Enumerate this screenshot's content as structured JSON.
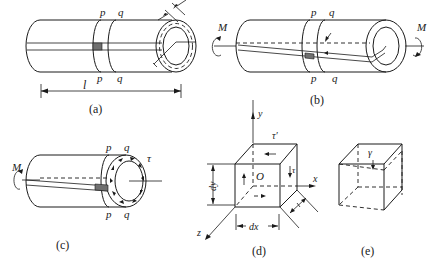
{
  "figure": {
    "panels": [
      {
        "id": "a",
        "caption": "(a)",
        "labels": {
          "section_p_top": "p",
          "section_q_top": "q",
          "section_p_bottom": "p",
          "section_q_bottom": "q",
          "length": "l"
        }
      },
      {
        "id": "b",
        "caption": "(b)",
        "labels": {
          "moment_left": "M",
          "moment_right": "M",
          "section_p_top": "p",
          "section_q_top": "q",
          "section_p_bottom": "p",
          "section_q_bottom": "q"
        }
      },
      {
        "id": "c",
        "caption": "(c)",
        "labels": {
          "moment": "M",
          "section_p_top": "p",
          "section_q_top": "q",
          "section_p_bottom": "p",
          "section_q_bottom": "q",
          "shear_stress": "τ"
        }
      },
      {
        "id": "d",
        "caption": "(d)",
        "labels": {
          "axis_y": "y",
          "axis_x": "x",
          "axis_z": "z",
          "origin": "O",
          "shear_top": "τ′",
          "shear_right": "τ",
          "dim_x": "dx",
          "dim_y": "dy",
          "dim_z": "t"
        }
      },
      {
        "id": "e",
        "caption": "(e)",
        "labels": {
          "shear_strain": "γ"
        }
      }
    ]
  },
  "colors": {
    "ink": "#1a1a1a",
    "shade": "#707070",
    "background": "#ffffff"
  }
}
